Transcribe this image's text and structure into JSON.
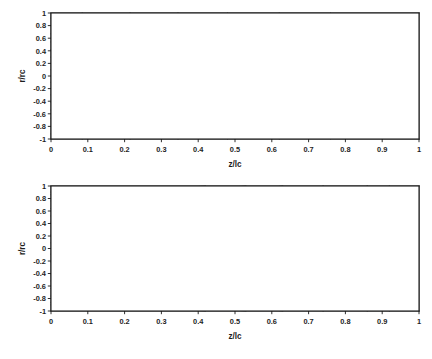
{
  "figure": {
    "background": "#ffffff",
    "line_color": "#3a3a3a",
    "grid_color": "#e2e2e2",
    "frame_color": "#1a1a1a"
  },
  "chart_data": [
    {
      "type": "line",
      "panel": "top",
      "title": "",
      "xlabel": "z/lc",
      "ylabel": "r/rc",
      "xlim": [
        0,
        1
      ],
      "ylim": [
        -1,
        1
      ],
      "grid": true,
      "legend": "none",
      "xticks": [
        "0",
        "0.1",
        "0.2",
        "0.3",
        "0.4",
        "0.5",
        "0.6",
        "0.7",
        "0.8",
        "0.9",
        "1"
      ],
      "xtick_values": [
        0,
        0.1,
        0.2,
        0.3,
        0.4,
        0.5,
        0.6,
        0.7,
        0.8,
        0.9,
        1
      ],
      "yticks": [
        "1",
        "0.8",
        "0.6",
        "0.4",
        "0.2",
        "0",
        "-0.2",
        "-0.4",
        "-0.6",
        "-0.8",
        "-1"
      ],
      "ytick_values": [
        1,
        0.8,
        0.6,
        0.4,
        0.2,
        0,
        -0.2,
        -0.4,
        -0.6,
        -0.8,
        -1
      ],
      "description": "Streamline contour field, symmetric about r/rc = 0, converging toward right edge",
      "series": [
        {
          "name": "streamline-+0.92",
          "start_r": 0.92,
          "exit_z": 0.085
        },
        {
          "name": "streamline-+0.80",
          "start_r": 0.8,
          "exit_z": 0.215
        },
        {
          "name": "streamline-+0.67",
          "start_r": 0.67,
          "exit_z": 0.345
        },
        {
          "name": "streamline-+0.54",
          "start_r": 0.54,
          "exit_z": 0.48
        },
        {
          "name": "streamline-+0.42",
          "start_r": 0.42,
          "exit_z": 0.62
        },
        {
          "name": "streamline-+0.30",
          "start_r": 0.3,
          "exit_z": 0.76
        },
        {
          "name": "streamline-+0.20",
          "start_r": 0.2,
          "exit_z": 0.88
        },
        {
          "name": "streamline-+0.10",
          "start_r": 0.1,
          "exit_z": 0.975
        },
        {
          "name": "axis-r0",
          "start_r": 0.0,
          "exit_z": 1.0
        },
        {
          "name": "streamline--0.10",
          "start_r": -0.1,
          "exit_z": 0.975
        },
        {
          "name": "streamline--0.20",
          "start_r": -0.2,
          "exit_z": 0.88
        },
        {
          "name": "streamline--0.30",
          "start_r": -0.3,
          "exit_z": 0.76
        },
        {
          "name": "streamline--0.42",
          "start_r": -0.42,
          "exit_z": 0.62
        },
        {
          "name": "streamline--0.54",
          "start_r": -0.54,
          "exit_z": 0.48
        },
        {
          "name": "streamline--0.67",
          "start_r": -0.67,
          "exit_z": 0.345
        },
        {
          "name": "streamline--0.80",
          "start_r": -0.8,
          "exit_z": 0.215
        },
        {
          "name": "streamline--0.92",
          "start_r": -0.92,
          "exit_z": 0.085
        }
      ]
    },
    {
      "type": "line",
      "panel": "bottom",
      "title": "",
      "xlabel": "z/lc",
      "ylabel": "r/rc",
      "xlim": [
        0,
        1
      ],
      "ylim": [
        -1,
        1
      ],
      "grid": true,
      "legend": "none",
      "xticks": [
        "0",
        "0.1",
        "0.2",
        "0.3",
        "0.4",
        "0.5",
        "0.6",
        "0.7",
        "0.8",
        "0.9",
        "1"
      ],
      "xtick_values": [
        0,
        0.1,
        0.2,
        0.3,
        0.4,
        0.5,
        0.6,
        0.7,
        0.8,
        0.9,
        1
      ],
      "yticks": [
        "1",
        "0.8",
        "0.6",
        "0.4",
        "0.2",
        "0",
        "-0.2",
        "-0.4",
        "-0.6",
        "-0.8",
        "-1"
      ],
      "ytick_values": [
        1,
        0.8,
        0.6,
        0.4,
        0.2,
        0,
        -0.2,
        -0.4,
        -0.6,
        -0.8,
        -1
      ],
      "description": "Streamline contour field, symmetric about r/rc = 0, with near-wall streamlines dipping inward before returning to the wall",
      "series": [
        {
          "name": "streamline-+0.90",
          "start_r": 0.9,
          "exit_z": 0.42
        },
        {
          "name": "streamline-+0.86",
          "start_r": 0.86,
          "exit_z": 0.53
        },
        {
          "name": "streamline-+0.76",
          "start_r": 0.76,
          "exit_z": 0.63
        },
        {
          "name": "streamline-+0.64",
          "start_r": 0.64,
          "exit_z": 0.74
        },
        {
          "name": "streamline-+0.52",
          "start_r": 0.52,
          "exit_z": 0.86
        },
        {
          "name": "streamline-+0.42",
          "start_r": 0.42,
          "exit_z": 0.92
        },
        {
          "name": "streamline-+0.22",
          "start_r": 0.22,
          "exit_z": 0.96
        },
        {
          "name": "streamline-+0.09",
          "start_r": 0.09,
          "exit_z": 0.99
        },
        {
          "name": "axis-r0",
          "start_r": 0.0,
          "exit_z": 1.0
        },
        {
          "name": "streamline--0.09",
          "start_r": -0.09,
          "exit_z": 0.99
        },
        {
          "name": "streamline--0.22",
          "start_r": -0.22,
          "exit_z": 0.96
        },
        {
          "name": "streamline--0.42",
          "start_r": -0.42,
          "exit_z": 0.92
        },
        {
          "name": "streamline--0.52",
          "start_r": -0.52,
          "exit_z": 0.86
        },
        {
          "name": "streamline--0.64",
          "start_r": -0.64,
          "exit_z": 0.74
        },
        {
          "name": "streamline--0.76",
          "start_r": -0.76,
          "exit_z": 0.63
        },
        {
          "name": "streamline--0.86",
          "start_r": -0.86,
          "exit_z": 0.53
        },
        {
          "name": "streamline--0.90",
          "start_r": -0.9,
          "exit_z": 0.42
        }
      ]
    }
  ]
}
